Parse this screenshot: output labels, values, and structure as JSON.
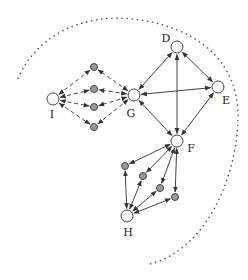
{
  "diagram": {
    "colors": {
      "line": "#444444",
      "boundary": "#555555",
      "node_large_fill": "#ffffff",
      "node_small_fill": "#9a9a9a",
      "node_stroke": "#444444"
    },
    "boundary": {
      "style": "dotted",
      "path": "M18,78 C40,30 90,12 140,20 C195,28 240,60 238,120 C236,180 205,250 150,264"
    },
    "nodes": [
      {
        "id": "D",
        "label": "D",
        "x": 177,
        "y": 47,
        "type": "large",
        "label_x": 166,
        "label_y": 42
      },
      {
        "id": "E",
        "label": "E",
        "x": 218,
        "y": 87,
        "type": "large",
        "label_x": 226,
        "label_y": 104
      },
      {
        "id": "G",
        "label": "G",
        "x": 134,
        "y": 95,
        "type": "large",
        "label_x": 131,
        "label_y": 117
      },
      {
        "id": "I",
        "label": "I",
        "x": 53,
        "y": 99,
        "type": "large",
        "label_x": 52,
        "label_y": 118
      },
      {
        "id": "F",
        "label": "F",
        "x": 177,
        "y": 141,
        "type": "large",
        "label_x": 191,
        "label_y": 152
      },
      {
        "id": "H",
        "label": "H",
        "x": 127,
        "y": 216,
        "type": "large",
        "label_x": 128,
        "label_y": 236
      },
      {
        "id": "s1",
        "label": "",
        "x": 94,
        "y": 67,
        "type": "small"
      },
      {
        "id": "s2",
        "label": "",
        "x": 94,
        "y": 89,
        "type": "small"
      },
      {
        "id": "s3",
        "label": "",
        "x": 94,
        "y": 107,
        "type": "small"
      },
      {
        "id": "s4",
        "label": "",
        "x": 94,
        "y": 127,
        "type": "small"
      },
      {
        "id": "s5",
        "label": "",
        "x": 125,
        "y": 166,
        "type": "small"
      },
      {
        "id": "s6",
        "label": "",
        "x": 143,
        "y": 176,
        "type": "small"
      },
      {
        "id": "s7",
        "label": "",
        "x": 160,
        "y": 188,
        "type": "small"
      },
      {
        "id": "s8",
        "label": "",
        "x": 175,
        "y": 197,
        "type": "small"
      }
    ],
    "edges": [
      {
        "from": "G",
        "to": "D",
        "style": "solid",
        "bidirectional": true
      },
      {
        "from": "G",
        "to": "E",
        "style": "solid",
        "bidirectional": true
      },
      {
        "from": "G",
        "to": "F",
        "style": "solid",
        "bidirectional": true
      },
      {
        "from": "D",
        "to": "E",
        "style": "solid",
        "bidirectional": true
      },
      {
        "from": "D",
        "to": "F",
        "style": "solid",
        "bidirectional": true
      },
      {
        "from": "E",
        "to": "F",
        "style": "solid",
        "bidirectional": true
      },
      {
        "from": "I",
        "to": "s1",
        "style": "dashed",
        "bidirectional": true
      },
      {
        "from": "I",
        "to": "s2",
        "style": "dashed",
        "bidirectional": true
      },
      {
        "from": "I",
        "to": "s3",
        "style": "dashed",
        "bidirectional": true
      },
      {
        "from": "I",
        "to": "s4",
        "style": "dashed",
        "bidirectional": true
      },
      {
        "from": "G",
        "to": "s1",
        "style": "dashed",
        "bidirectional": true
      },
      {
        "from": "G",
        "to": "s2",
        "style": "dashed",
        "bidirectional": true
      },
      {
        "from": "G",
        "to": "s3",
        "style": "dashed",
        "bidirectional": true
      },
      {
        "from": "G",
        "to": "s4",
        "style": "dashed",
        "bidirectional": true
      },
      {
        "from": "F",
        "to": "s5",
        "style": "solid",
        "bidirectional": true
      },
      {
        "from": "F",
        "to": "s6",
        "style": "solid",
        "bidirectional": true
      },
      {
        "from": "F",
        "to": "s7",
        "style": "solid",
        "bidirectional": true
      },
      {
        "from": "F",
        "to": "s8",
        "style": "solid",
        "bidirectional": true
      },
      {
        "from": "H",
        "to": "s5",
        "style": "solid",
        "bidirectional": true
      },
      {
        "from": "H",
        "to": "s6",
        "style": "solid",
        "bidirectional": true
      },
      {
        "from": "H",
        "to": "s7",
        "style": "solid",
        "bidirectional": true
      },
      {
        "from": "H",
        "to": "s8",
        "style": "solid",
        "bidirectional": true
      }
    ]
  }
}
